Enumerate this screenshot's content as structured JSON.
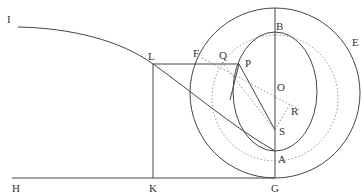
{
  "diagram": {
    "title": "",
    "stroke_color": "#444444",
    "dotted_color": "#777777",
    "labels": [
      {
        "id": "I",
        "text": "I",
        "x": 7,
        "y": 14
      },
      {
        "id": "L",
        "text": "L",
        "x": 148,
        "y": 51
      },
      {
        "id": "F",
        "text": "F",
        "x": 193,
        "y": 48
      },
      {
        "id": "Q",
        "text": "Q",
        "x": 219,
        "y": 50
      },
      {
        "id": "P",
        "text": "P",
        "x": 245,
        "y": 58
      },
      {
        "id": "B",
        "text": "B",
        "x": 276,
        "y": 21
      },
      {
        "id": "E",
        "text": "E",
        "x": 352,
        "y": 37
      },
      {
        "id": "O",
        "text": "O",
        "x": 277,
        "y": 82
      },
      {
        "id": "R",
        "text": "R",
        "x": 291,
        "y": 106
      },
      {
        "id": "S",
        "text": "S",
        "x": 279,
        "y": 126
      },
      {
        "id": "A",
        "text": "A",
        "x": 278,
        "y": 154
      },
      {
        "id": "H",
        "text": "H",
        "x": 12,
        "y": 183
      },
      {
        "id": "K",
        "text": "K",
        "x": 149,
        "y": 183
      },
      {
        "id": "G",
        "text": "G",
        "x": 271,
        "y": 183
      }
    ]
  }
}
